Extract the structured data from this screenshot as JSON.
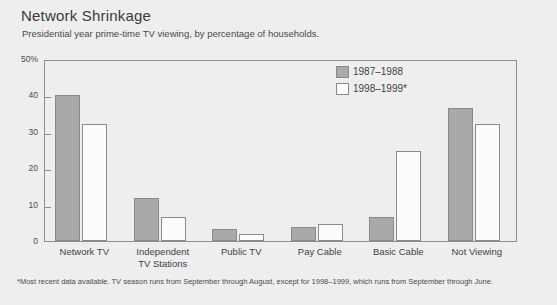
{
  "chart_data": {
    "type": "bar",
    "title": "Network Shrinkage",
    "subtitle": "Presidential year prime-time TV viewing, by percentage of households.",
    "footnote": "*Most recent data available. TV season runs from September through August, except for 1998–1999, which runs from September through June.",
    "categories": [
      "Network TV",
      "Independent\nTV Stations",
      "Public TV",
      "Pay Cable",
      "Basic Cable",
      "Not Viewing"
    ],
    "series": [
      {
        "name": "1987–1988",
        "color": "#a9a9a9",
        "values": [
          40.5,
          12.0,
          3.3,
          4.0,
          6.8,
          37.0
        ]
      },
      {
        "name": "1998–1999*",
        "color": "#fbfbfb",
        "values": [
          32.5,
          6.7,
          2.0,
          4.8,
          25.0,
          32.5
        ]
      }
    ],
    "xlabel": "",
    "ylabel": "",
    "ylim": [
      0,
      50
    ],
    "yticks": [
      0,
      10,
      20,
      30,
      40,
      50
    ],
    "ytick_labels": [
      "0",
      "10",
      "20",
      "30",
      "40",
      "50%"
    ],
    "grid": false,
    "legend_position": "upper-center-right"
  },
  "colors": {
    "background": "#eeeeee",
    "frame": "#8e8e8e",
    "text": "#3f3f3f",
    "series_1987": "#a9a9a9",
    "series_1998": "#fbfbfb"
  }
}
